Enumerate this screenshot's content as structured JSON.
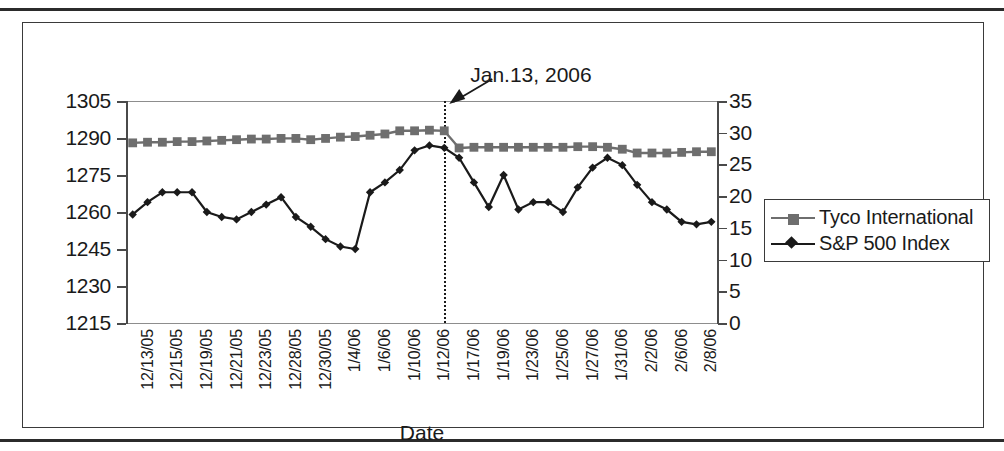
{
  "chart_data": {
    "type": "line",
    "title": "",
    "xlabel": "Date",
    "ylabel": "",
    "annotation": "Jan.13, 2006",
    "annotation_x_category": "1/13/06",
    "grid": false,
    "legend_position": "right",
    "y_left": {
      "label": "",
      "ticks": [
        1215,
        1230,
        1245,
        1260,
        1275,
        1290,
        1305
      ],
      "ylim": [
        1215,
        1305
      ]
    },
    "y_right": {
      "label": "",
      "ticks": [
        0,
        5,
        10,
        15,
        20,
        25,
        30,
        35
      ],
      "ylim": [
        0,
        35
      ]
    },
    "categories": [
      "12/13/05",
      "12/14/05",
      "12/15/05",
      "12/16/05",
      "12/19/05",
      "12/20/05",
      "12/21/05",
      "12/22/05",
      "12/23/05",
      "12/27/05",
      "12/28/05",
      "12/29/05",
      "12/30/05",
      "1/3/06",
      "1/4/06",
      "1/5/06",
      "1/6/06",
      "1/9/06",
      "1/10/06",
      "1/11/06",
      "1/12/06",
      "1/13/06",
      "1/17/06",
      "1/18/06",
      "1/19/06",
      "1/20/06",
      "1/23/06",
      "1/24/06",
      "1/25/06",
      "1/26/06",
      "1/27/06",
      "1/30/06",
      "1/31/06",
      "2/1/06",
      "2/2/06",
      "2/3/06",
      "2/6/06",
      "2/7/06",
      "2/8/06",
      "2/9/06"
    ],
    "tick_labels": [
      "12/13/05",
      "12/15/05",
      "12/19/05",
      "12/21/05",
      "12/23/05",
      "12/28/05",
      "12/30/05",
      "1/4/06",
      "1/6/06",
      "1/10/06",
      "1/12/06",
      "1/17/06",
      "1/19/06",
      "1/23/06",
      "1/25/06",
      "1/27/06",
      "1/31/06",
      "2/2/06",
      "2/6/06",
      "2/8/06"
    ],
    "tick_label_indices": [
      0,
      2,
      4,
      6,
      8,
      10,
      12,
      14,
      16,
      18,
      20,
      22,
      24,
      26,
      28,
      30,
      32,
      34,
      36,
      38
    ],
    "series": [
      {
        "name": "Tyco International",
        "axis": "right",
        "color": "#6e6e6e",
        "marker": "square",
        "values": [
          28.4,
          28.5,
          28.5,
          28.6,
          28.6,
          28.7,
          28.8,
          28.9,
          29.0,
          29.0,
          29.1,
          29.1,
          28.9,
          29.1,
          29.3,
          29.4,
          29.6,
          29.8,
          30.3,
          30.3,
          30.4,
          30.3,
          27.6,
          27.7,
          27.7,
          27.7,
          27.7,
          27.7,
          27.7,
          27.7,
          27.8,
          27.8,
          27.7,
          27.4,
          26.8,
          26.8,
          26.8,
          26.9,
          27.0,
          27.0
        ]
      },
      {
        "name": "S&P 500 Index",
        "axis": "left",
        "color": "#1a1a1a",
        "marker": "diamond",
        "values": [
          1259,
          1264,
          1268,
          1268,
          1268,
          1260,
          1258,
          1257,
          1260,
          1263,
          1266,
          1258,
          1254,
          1249,
          1246,
          1245,
          1268,
          1272,
          1277,
          1285,
          1287,
          1286,
          1282,
          1272,
          1262,
          1275,
          1261,
          1264,
          1264,
          1260,
          1270,
          1278,
          1282,
          1279,
          1271,
          1264,
          1261,
          1256,
          1255,
          1256
        ]
      }
    ]
  },
  "legend": {
    "items": [
      {
        "label": "Tyco International"
      },
      {
        "label": "S&P 500 Index"
      }
    ]
  },
  "axis_titles": {
    "x": "Date"
  },
  "annotation": {
    "text": "Jan.13, 2006"
  }
}
